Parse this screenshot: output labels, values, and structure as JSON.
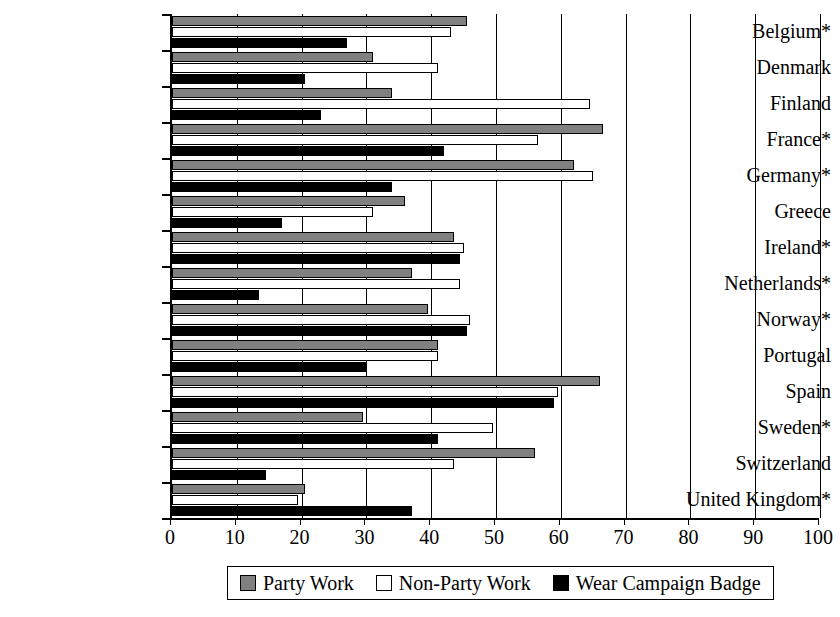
{
  "chart_data": {
    "type": "bar",
    "orientation": "horizontal",
    "title": "",
    "xlabel": "",
    "ylabel": "",
    "xlim": [
      0,
      100
    ],
    "xticks": [
      0,
      10,
      20,
      30,
      40,
      50,
      60,
      70,
      80,
      90,
      100
    ],
    "grid": true,
    "grid_axis": "x",
    "legend_position": "bottom",
    "categories": [
      "Belgium*",
      "Denmark",
      "Finland",
      "France*",
      "Germany*",
      "Greece",
      "Ireland*",
      "Netherlands*",
      "Norway*",
      "Portugal",
      "Spain",
      "Sweden*",
      "Switzerland",
      "United Kingdom*"
    ],
    "series": [
      {
        "name": "Party Work",
        "color": "#808080",
        "values": [
          45.5,
          31,
          34,
          66.5,
          62,
          36,
          43.5,
          37,
          39.5,
          41,
          66,
          29.5,
          56,
          20.5
        ]
      },
      {
        "name": "Non-Party Work",
        "color": "#ffffff",
        "values": [
          43,
          41,
          64.5,
          56.5,
          65,
          31,
          45,
          44.5,
          46,
          41,
          59.5,
          49.5,
          43.5,
          19.5
        ]
      },
      {
        "name": "Wear Campaign Badge",
        "color": "#000000",
        "values": [
          27,
          20.5,
          23,
          42,
          34,
          17,
          44.5,
          13.5,
          45.5,
          30,
          59,
          41,
          14.5,
          37
        ]
      }
    ]
  },
  "legend": {
    "items": [
      {
        "label": "Party Work",
        "swatch": "party"
      },
      {
        "label": "Non-Party Work",
        "swatch": "nonparty"
      },
      {
        "label": "Wear Campaign Badge",
        "swatch": "badge"
      }
    ]
  }
}
